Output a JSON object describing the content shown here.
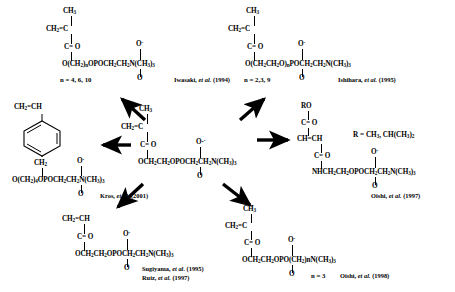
{
  "figure": {
    "type": "chemical-structure-diagram"
  },
  "center": {
    "id": "mpc-core",
    "lines": [
      {
        "text": "CH3"
      },
      {
        "text": "CH2=C"
      },
      {
        "text": "C= O"
      },
      {
        "text": "O·"
      },
      {
        "text": "OCH2CH2OPOCH2CH2N(CH3)3"
      },
      {
        "text": "O"
      }
    ],
    "name": "MPC"
  },
  "structures": [
    {
      "id": "top-left",
      "position": "top-left",
      "top_group": "CH3",
      "vinyl": "CH2=C",
      "carbonyl": "C= O",
      "oxygen_anion": "O",
      "chain": "O(CH2)nOPOCH2CH2N(CH3)3",
      "bottom_o": "O",
      "n_value": "n = 4, 6, 10",
      "citation_author": "Iwasaki,",
      "citation_etal": "et al.",
      "citation_year": "(1994)"
    },
    {
      "id": "top-right",
      "position": "top-right",
      "top_group": "CH3",
      "vinyl": "CH2=C",
      "carbonyl": "C= O",
      "oxygen_anion": "O",
      "chain": "O(CH2CH2O)nPOCH2CH2N(CH3)3",
      "bottom_o": "O",
      "n_value": "n = 2,3, 9",
      "citation_author": "Ishihara,",
      "citation_etal": "et al.",
      "citation_year": "(1995)"
    },
    {
      "id": "left-styrene",
      "position": "left",
      "vinyl": "CH2=CH",
      "ring": "benzene-ring",
      "methylene": "CH2",
      "oxygen_anion": "O",
      "chain": "O(CH2)4OPOCH2CH2N(CH3)3",
      "bottom_o": "O",
      "citation_author": "Kros,",
      "citation_etal": "et al.",
      "citation_year": "(2001)"
    },
    {
      "id": "right-maleate",
      "position": "right",
      "ro_group": "RO",
      "carbonyl_top": "C= O",
      "alkene": "CH=CH",
      "carbonyl_bottom": "C= O",
      "oxygen_anion": "O",
      "chain": "NHCH2CH2OPOCH2CH2N(CH3)3",
      "bottom_o": "O",
      "r_definition": "R = CH3,  CH(CH3)2",
      "citation_author": "Oishi,",
      "citation_etal": "et al.",
      "citation_year": "(1997)"
    },
    {
      "id": "bottom-left-acrylate",
      "position": "bottom-left",
      "vinyl": "CH2=CH",
      "carbonyl": "C= O",
      "oxygen_anion": "O",
      "chain": "OCH2CH2OPOCH2CH2N(CH3)3",
      "bottom_o": "O",
      "citation_author": "Sugiyama,",
      "citation_etal": "et al.",
      "citation_year": "(1995)",
      "citation2_author": "Ruiz,",
      "citation2_etal": "et al.",
      "citation2_year": "(1997)"
    },
    {
      "id": "bottom-right",
      "position": "bottom-right",
      "top_group": "CH3",
      "vinyl": "CH2=C",
      "carbonyl": "C= O",
      "oxygen_anion": "O",
      "chain": "OCH2CH2OPO(CH2)nN(CH3)3",
      "bottom_o": "O",
      "n_value": "n = 3",
      "citation_author": "Oishi,",
      "citation_etal": "et al.",
      "citation_year": "(1998)"
    }
  ],
  "arrows": [
    {
      "id": "arrow-to-top-left",
      "direction": "up-left"
    },
    {
      "id": "arrow-to-top-right",
      "direction": "up-right"
    },
    {
      "id": "arrow-to-left",
      "direction": "left"
    },
    {
      "id": "arrow-to-right",
      "direction": "right"
    },
    {
      "id": "arrow-to-bottom-left",
      "direction": "down-left"
    },
    {
      "id": "arrow-to-bottom-right",
      "direction": "down-right"
    }
  ],
  "colors": {
    "ink": "#000000",
    "background": "#ffffff"
  }
}
